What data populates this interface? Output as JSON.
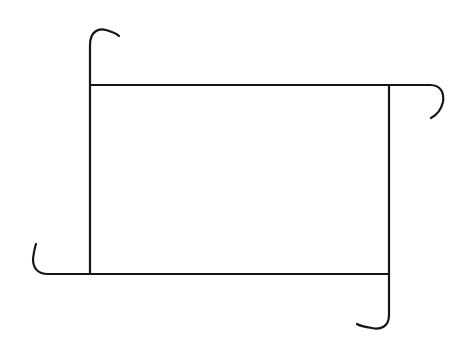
{
  "figure": {
    "title": "Rectangle with curled corner hooks",
    "background_color": "#ffffff",
    "stroke_color": "#151515",
    "stroke_width": 2.2,
    "canvas": {
      "width": 470,
      "height": 350
    },
    "rectangle": {
      "name": "central-rectangle",
      "left": 90,
      "top": 85,
      "right": 389,
      "bottom": 274,
      "width": 299,
      "height": 189
    },
    "strokes": [
      {
        "name": "top-edge",
        "kind": "line",
        "d": "M 90 85 L 389 85"
      },
      {
        "name": "bottom-edge",
        "kind": "line",
        "d": "M 90 274 L 389 274"
      },
      {
        "name": "left-edge",
        "kind": "line",
        "d": "M 90 85 L 90 274"
      },
      {
        "name": "right-edge",
        "kind": "line",
        "d": "M 389 85 L 389 274"
      },
      {
        "name": "top-left-hook",
        "kind": "line-with-arc",
        "description": "Left edge continues upward above the rectangle then curls over to the right like a shepherd's crook.",
        "d": "M 90 85 L 90 45 C 90 31 99 28 106 30 C 113 32 117 34 119 36"
      },
      {
        "name": "top-right-hook",
        "kind": "line-with-arc",
        "description": "Top edge continues rightward past the rectangle then curls down and back to the left.",
        "d": "M 389 85 L 430 85 C 442 85 444 94 443 102 C 441 110 437 115 431 118"
      },
      {
        "name": "bottom-left-hook",
        "kind": "line-with-arc",
        "description": "Bottom edge continues leftward past the rectangle then curls up and back to the right.",
        "d": "M 90 274 L 48 274 C 36 274 33 266 33 259 C 34 251 35 247 36 244"
      },
      {
        "name": "bottom-right-hook",
        "kind": "line-with-arc",
        "description": "Right edge continues downward below the rectangle then curls to the left.",
        "d": "M 389 274 L 389 315 C 389 327 380 330 372 328 C 365 327 360 326 357 324"
      }
    ]
  }
}
